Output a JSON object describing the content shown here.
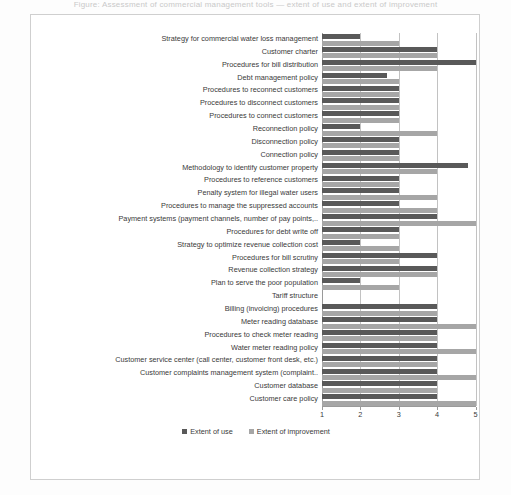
{
  "page": {
    "cropped_title": "Figure: Assessment of commercial management tools — extent of use and extent of improvement"
  },
  "chart_data": {
    "type": "bar",
    "orientation": "horizontal",
    "title": "",
    "xlabel": "",
    "ylabel": "",
    "xlim": [
      1,
      5
    ],
    "xticks": [
      "1",
      "2",
      "3",
      "4",
      "5"
    ],
    "grid": true,
    "legend_position": "bottom",
    "legend": [
      "Extent of use",
      "Extent of improvement"
    ],
    "colors": {
      "extent_of_use": "#595959",
      "extent_of_improvement": "#a6a6a6",
      "gridline": "#c2c2c2",
      "axis": "#9a9a9a",
      "text": "#3a3a3a",
      "frame": "#cfcfcf",
      "background": "#ffffff"
    },
    "categories": [
      "Strategy for commercial water loss management",
      "Customer charter",
      "Procedures for bill distribution",
      "Debt management policy",
      "Procedures to reconnect customers",
      "Procedures to disconnect customers",
      "Procedures to connect customers",
      "Reconnection policy",
      "Disconnection policy",
      "Connection policy",
      "Methodology to identify customer property",
      "Procedures to reference customers",
      "Penalty system  for illegal water users",
      "Procedures to manage the suppressed accounts",
      "Payment systems (payment channels, number of pay points,..",
      "Procedures for debt write off",
      "Strategy to optimize revenue collection cost",
      "Procedures for bill scrutiny",
      "Revenue collection strategy",
      "Plan to serve the poor population",
      "Tariff structure",
      "Billing (invoicing) procedures",
      "Meter reading database",
      "Procedures to check meter reading",
      "Water meter reading policy",
      "Customer service center (call center, customer front desk, etc.)",
      "Customer complaints management system (complaint..",
      "Customer database",
      "Customer care policy"
    ],
    "series": [
      {
        "name": "Extent of use",
        "color": "#595959",
        "values": [
          2.0,
          4.0,
          5.0,
          2.7,
          3.0,
          3.0,
          3.0,
          2.0,
          3.0,
          3.0,
          4.8,
          3.0,
          3.0,
          3.0,
          4.0,
          3.0,
          2.0,
          4.0,
          4.0,
          2.0,
          1.0,
          4.0,
          4.0,
          4.0,
          4.0,
          4.0,
          4.0,
          4.0,
          4.0
        ]
      },
      {
        "name": "Extent of improvement",
        "color": "#a6a6a6",
        "values": [
          3.0,
          4.0,
          4.0,
          3.0,
          3.0,
          3.0,
          3.0,
          4.0,
          3.0,
          3.0,
          4.0,
          3.0,
          4.0,
          4.0,
          5.0,
          3.0,
          3.0,
          3.0,
          4.0,
          3.0,
          1.0,
          4.0,
          5.0,
          4.0,
          5.0,
          4.0,
          5.0,
          4.0,
          5.0
        ]
      }
    ]
  }
}
